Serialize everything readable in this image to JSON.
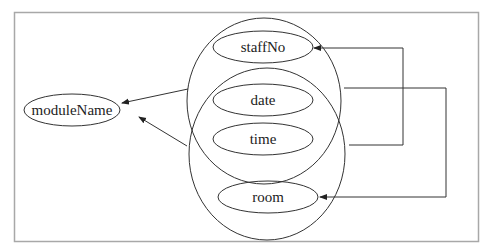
{
  "diagram": {
    "type": "functional-dependency diagram",
    "colors": {
      "background": "#ffffff",
      "frame": "#a8a8a8",
      "stroke": "#333333",
      "text": "#222222"
    },
    "nodes": {
      "moduleName": {
        "label": "moduleName"
      },
      "staffNo": {
        "label": "staffNo"
      },
      "date": {
        "label": "date"
      },
      "time": {
        "label": "time"
      },
      "room": {
        "label": "room"
      }
    },
    "groups": [
      {
        "name": "upper-determinant-group",
        "members": [
          "staffNo",
          "date",
          "time"
        ]
      },
      {
        "name": "lower-determinant-group",
        "members": [
          "date",
          "time",
          "room"
        ]
      }
    ],
    "edges": [
      {
        "from": "upper-determinant-group",
        "to": "moduleName"
      },
      {
        "from": "lower-determinant-group",
        "to": "moduleName"
      },
      {
        "from": "date-time-group",
        "to": "staffNo"
      },
      {
        "from": "upper-determinant-group",
        "to": "room"
      }
    ]
  }
}
